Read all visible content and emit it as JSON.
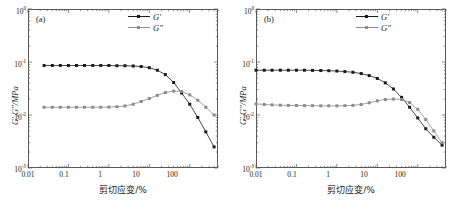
{
  "figure": {
    "panels": [
      {
        "tag": "(a)",
        "xlabel": "剪切应变/%",
        "ylabel": "G′,G″/MPa",
        "legend": [
          {
            "label": "G′"
          },
          {
            "label": "G″"
          }
        ],
        "xticks": [
          "0.01",
          "0.1",
          "1",
          "10",
          "100"
        ],
        "yticks": [
          "10",
          "10",
          "10",
          "10"
        ],
        "yexps": [
          "0",
          "-1",
          "-2",
          "-3"
        ]
      },
      {
        "tag": "(b)",
        "xlabel": "剪切应变/%",
        "ylabel": "G′,G″/MPa",
        "legend": [
          {
            "label": "G′"
          },
          {
            "label": "G″"
          }
        ],
        "xticks": [
          "0.01",
          "0.1",
          "1",
          "10",
          "100"
        ],
        "yticks": [
          "10",
          "10",
          "10",
          "10"
        ],
        "yexps": [
          "0",
          "-1",
          "-2",
          "-3"
        ]
      }
    ]
  },
  "colors": {
    "g_prime": "#1a1a1a",
    "g_double_prime": "#8c8c8c",
    "frame": "#5a5a5a"
  },
  "chart_data": [
    {
      "type": "line",
      "title": "(a)",
      "xlabel": "剪切应变/%",
      "ylabel": "G′,G″/MPa",
      "xscale": "log",
      "yscale": "log",
      "xlim": [
        0.01,
        500
      ],
      "ylim": [
        0.001,
        1
      ],
      "grid": false,
      "legend_position": "top-right",
      "series": [
        {
          "name": "G′",
          "color": "#1a1a1a",
          "x": [
            0.025,
            0.04,
            0.063,
            0.1,
            0.158,
            0.25,
            0.4,
            0.63,
            1.0,
            1.58,
            2.5,
            4.0,
            6.3,
            10.0,
            15.8,
            25.0,
            40.0,
            63.0,
            100.0,
            158.0,
            250.0,
            400.0
          ],
          "y": [
            0.086,
            0.086,
            0.086,
            0.086,
            0.086,
            0.086,
            0.086,
            0.086,
            0.086,
            0.085,
            0.085,
            0.084,
            0.082,
            0.078,
            0.07,
            0.058,
            0.041,
            0.026,
            0.016,
            0.009,
            0.0048,
            0.0025
          ]
        },
        {
          "name": "G″",
          "color": "#8c8c8c",
          "x": [
            0.025,
            0.04,
            0.063,
            0.1,
            0.158,
            0.25,
            0.4,
            0.63,
            1.0,
            1.58,
            2.5,
            4.0,
            6.3,
            10.0,
            15.8,
            25.0,
            40.0,
            63.0,
            100.0,
            158.0,
            250.0,
            400.0
          ],
          "y": [
            0.014,
            0.014,
            0.014,
            0.014,
            0.014,
            0.014,
            0.014,
            0.014,
            0.0141,
            0.0143,
            0.0148,
            0.016,
            0.018,
            0.0205,
            0.0235,
            0.0265,
            0.0283,
            0.0278,
            0.024,
            0.019,
            0.014,
            0.01
          ]
        }
      ],
      "annotations": [
        "G′ and G″ cross near 45% strain"
      ]
    },
    {
      "type": "line",
      "title": "(b)",
      "xlabel": "剪切应变/%",
      "ylabel": "G′,G″/MPa",
      "xscale": "log",
      "yscale": "log",
      "xlim": [
        0.01,
        500
      ],
      "ylim": [
        0.001,
        1
      ],
      "grid": false,
      "legend_position": "top-right",
      "series": [
        {
          "name": "G′",
          "color": "#1a1a1a",
          "x": [
            0.01,
            0.016,
            0.025,
            0.04,
            0.063,
            0.1,
            0.158,
            0.25,
            0.4,
            0.63,
            1.0,
            1.58,
            2.5,
            4.0,
            6.3,
            10.0,
            15.8,
            25.0,
            40.0,
            63.0,
            100.0,
            158.0,
            250.0,
            400.0
          ],
          "y": [
            0.07,
            0.07,
            0.07,
            0.07,
            0.07,
            0.07,
            0.07,
            0.0695,
            0.069,
            0.0685,
            0.0675,
            0.066,
            0.064,
            0.0605,
            0.0555,
            0.049,
            0.0405,
            0.031,
            0.0215,
            0.014,
            0.0088,
            0.0055,
            0.0038,
            0.0027
          ]
        },
        {
          "name": "G″",
          "color": "#8c8c8c",
          "x": [
            0.01,
            0.016,
            0.025,
            0.04,
            0.063,
            0.1,
            0.158,
            0.25,
            0.4,
            0.63,
            1.0,
            1.58,
            2.5,
            4.0,
            6.3,
            10.0,
            15.8,
            25.0,
            40.0,
            63.0,
            100.0,
            158.0,
            250.0,
            400.0
          ],
          "y": [
            0.0162,
            0.0158,
            0.0155,
            0.0153,
            0.0152,
            0.0151,
            0.015,
            0.015,
            0.0149,
            0.0149,
            0.0149,
            0.015,
            0.0152,
            0.0158,
            0.017,
            0.0185,
            0.0196,
            0.02,
            0.0196,
            0.0172,
            0.0128,
            0.0082,
            0.005,
            0.003
          ]
        }
      ],
      "annotations": [
        "G′ and G″ cross near 80% strain"
      ]
    }
  ]
}
